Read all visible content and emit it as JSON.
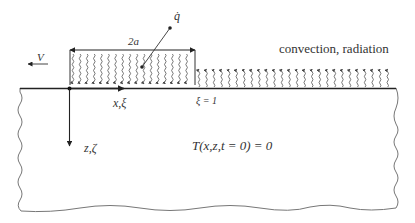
{
  "diagram": {
    "velocity_label": "V",
    "heat_flux_label": "q̇",
    "width_label": "2a",
    "x_axis_label": "x,ξ",
    "z_axis_label": "z,ζ",
    "boundary_label": "ξ = 1",
    "surface_condition_label": "convection, radiation",
    "initial_condition_label": "T(x,z,t = 0) = 0"
  },
  "colors": {
    "line": "#222222",
    "wavy_arrow": "#555555",
    "border": "#777777",
    "text": "#333333"
  }
}
